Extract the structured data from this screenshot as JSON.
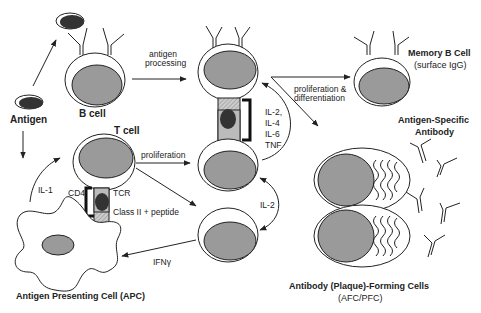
{
  "diagram": {
    "type": "immunology-pathway",
    "colors": {
      "line": "#222222",
      "nucleus": "#9a9a9a",
      "antigen": "#333333",
      "background": "#ffffff",
      "hatch": "#bbbbbb"
    },
    "nodes": {
      "antigen": {
        "label": "Antigen"
      },
      "b_cell": {
        "label": "B cell"
      },
      "t_cell": {
        "label": "T cell"
      },
      "apc": {
        "label": "Antigen Presenting Cell (APC)"
      },
      "memory_b": {
        "label": "Memory B Cell",
        "sublabel": "(surface IgG)"
      },
      "antibody": {
        "label_line1": "Antigen-Specific",
        "label_line2": "Antibody"
      },
      "afc": {
        "label": "Antibody (Plaque)-Forming Cells",
        "sublabel": "(AFC/PFC)"
      }
    },
    "edge_labels": {
      "antigen_processing_1": "antigen",
      "antigen_processing_2": "processing",
      "proliferation": "proliferation",
      "prolif_diff_1": "proliferation &",
      "prolif_diff_2": "differentiation",
      "il1": "IL-1",
      "il2": "IL-2",
      "ifng": "IFNγ",
      "cytokines": [
        "IL-2,",
        "IL-4",
        "IL-6",
        "TNF"
      ]
    },
    "synapse_labels": {
      "cd4": "CD4",
      "tcr": "TCR",
      "mhc": "Class II + peptide"
    }
  }
}
